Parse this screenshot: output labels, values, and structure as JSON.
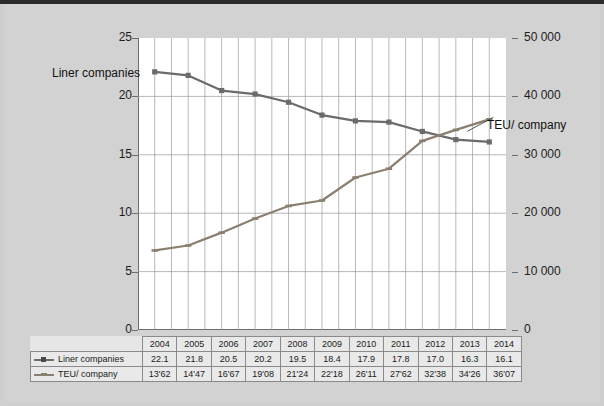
{
  "chart_data": {
    "type": "line",
    "title": "",
    "xlabel": "",
    "categories": [
      "2004",
      "2005",
      "2006",
      "2007",
      "2008",
      "2009",
      "2010",
      "2011",
      "2012",
      "2013",
      "2014"
    ],
    "grid": true,
    "legend_position": "table-below",
    "axes": {
      "left": {
        "label": "Liner companies",
        "ylim": [
          0,
          25
        ],
        "ticks": [
          "0",
          "5",
          "10",
          "15",
          "20",
          "25"
        ],
        "tick_values": [
          0,
          5,
          10,
          15,
          20,
          25
        ]
      },
      "right": {
        "label": "TEU/ company",
        "ylim": [
          0,
          50000
        ],
        "ticks": [
          "0",
          "10 000",
          "20 000",
          "30 000",
          "40 000",
          "50 000"
        ],
        "tick_values": [
          0,
          10000,
          20000,
          30000,
          40000,
          50000
        ]
      }
    },
    "series": [
      {
        "name": "Liner companies",
        "axis": "left",
        "color": "#6b6b6b",
        "marker": "square",
        "values": [
          22.1,
          21.8,
          20.5,
          20.2,
          19.5,
          18.4,
          17.9,
          17.8,
          17.0,
          16.3,
          16.1
        ],
        "labels": [
          "22.1",
          "21.8",
          "20.5",
          "20.2",
          "19.5",
          "18.4",
          "17.9",
          "17.8",
          "17.0",
          "16.3",
          "16.1"
        ]
      },
      {
        "name": "TEU/ company",
        "axis": "right",
        "color": "#8b8070",
        "marker": "dash",
        "values": [
          13620,
          14470,
          16670,
          19080,
          21240,
          22180,
          26110,
          27620,
          32380,
          34260,
          36070
        ],
        "labels": [
          "13'62",
          "14'47",
          "16'67",
          "19'08",
          "21'24",
          "22'18",
          "26'11",
          "27'62",
          "32'38",
          "34'26",
          "36'07"
        ]
      }
    ],
    "annotations": [
      {
        "name": "liner-companies-annotation",
        "text": "Liner companies"
      },
      {
        "name": "teu-company-annotation",
        "text": "TEU/ company"
      }
    ]
  },
  "table": {
    "year_row_label": "",
    "rows": [
      {
        "label": "Liner companies",
        "marker": "square"
      },
      {
        "label": "TEU/ company",
        "marker": "dash"
      }
    ]
  },
  "colors": {
    "background": "#cfcfcf",
    "plot_background": "#ffffff",
    "grid": "#9a9a9a",
    "axis": "#6e6e6e",
    "series_liner": "#6b6b6b",
    "series_teu": "#8b8070"
  }
}
